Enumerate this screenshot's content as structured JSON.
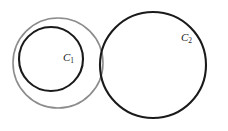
{
  "figure": {
    "background_color": "#ffffff",
    "width": 228,
    "height": 131,
    "shapes": [
      {
        "id": "outer-gray-circle",
        "name": "outer-gray-circle",
        "role": "construction-circle",
        "cx": 58,
        "cy": 63,
        "r": 45,
        "stroke": "#8c8c8c",
        "stroke_width": 1.6,
        "label": ""
      },
      {
        "id": "circle-c1",
        "name": "circle-c1",
        "role": "labeled-circle",
        "cx": 51,
        "cy": 59,
        "r": 32,
        "stroke": "#1a1a1a",
        "stroke_width": 2.1,
        "label": "C",
        "label_subscript": "1",
        "label_x": 63,
        "label_y": 58
      },
      {
        "id": "circle-c2",
        "name": "circle-c2",
        "role": "labeled-circle",
        "cx": 153,
        "cy": 65,
        "r": 53,
        "stroke": "#1a1a1a",
        "stroke_width": 2.1,
        "label": "C",
        "label_subscript": "2",
        "label_x": 181,
        "label_y": 38
      }
    ],
    "labels": {
      "c1": "C",
      "c1_sub": "1",
      "c2": "C",
      "c2_sub": "2"
    }
  }
}
